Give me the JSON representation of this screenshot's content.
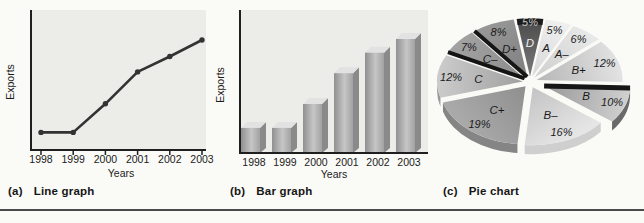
{
  "page": {
    "background": "#fafaf7",
    "divider_color": "#4a4a4a"
  },
  "chart_data": [
    {
      "type": "line",
      "caption_prefix": "(a)",
      "caption_label": "Line graph",
      "xlabel": "Years",
      "ylabel": "Exports",
      "categories": [
        "1998",
        "1999",
        "2000",
        "2001",
        "2002",
        "2003"
      ],
      "values": [
        16,
        16,
        42,
        71,
        85,
        100
      ],
      "ylim": [
        0,
        110
      ],
      "grid": false,
      "line_color": "#333333",
      "axis_color": "#1f1f1f",
      "plot_bg": "#ecece9"
    },
    {
      "type": "bar",
      "caption_prefix": "(b)",
      "caption_label": "Bar graph",
      "xlabel": "Years",
      "ylabel": "Exports",
      "categories": [
        "1998",
        "1999",
        "2000",
        "2001",
        "2002",
        "2003"
      ],
      "values": [
        22,
        22,
        43,
        70,
        88,
        100
      ],
      "ylim": [
        0,
        115
      ],
      "grid": false,
      "bar_colors": {
        "front_left": "#909090",
        "front_mid": "#c6c6c6",
        "front_right": "#a2a2a2",
        "top": "#e2e2e2",
        "side": "#8a8a8a"
      },
      "axis_color": "#1f1f1f",
      "plot_bg": "#ecece9"
    },
    {
      "type": "pie",
      "caption_prefix": "(c)",
      "caption_label": "Pie chart",
      "start_angle_deg": -9,
      "direction": "clockwise",
      "slices": [
        {
          "label": "D",
          "pct": 5,
          "inner": "#7a7a7a",
          "outer": "#4a4a4a",
          "letter_color": "#f0f0f0",
          "pct_color": "#c6c6c6",
          "accent": "arc",
          "accent_color": "#1c1c1c",
          "explode": 7,
          "letter_r": 0.58,
          "pct_r": 0.93
        },
        {
          "label": "A",
          "pct": 5,
          "inner": "#d8d8d8",
          "outer": "#efefef"
        },
        {
          "label": "A–",
          "pct": 6,
          "inner": "#cfcfcf",
          "outer": "#e8e8e8"
        },
        {
          "label": "B+",
          "pct": 12,
          "inner": "#b6b6b6",
          "outer": "#e2e2e2",
          "rim": "#d8d8d8"
        },
        {
          "label": "B",
          "pct": 10,
          "inner": "#989898",
          "outer": "#cfcfcf",
          "accent": "start",
          "accent_color": "#161616",
          "accent_width": 5,
          "rim": "#6a6a6a",
          "explode": 15
        },
        {
          "label": "B–",
          "pct": 16,
          "inner": "#c3c3c3",
          "outer": "#e5e5e5",
          "rim": "#cfcfcf"
        },
        {
          "label": "C+",
          "pct": 19,
          "inner": "#8f8f8f",
          "outer": "#a9a9a9",
          "rim": "#858585"
        },
        {
          "label": "C",
          "pct": 12,
          "inner": "#a0a0a0",
          "outer": "#cccccc",
          "rim": "#9a9a9a"
        },
        {
          "label": "C–",
          "pct": 7,
          "inner": "#8c8c8c",
          "outer": "#a2a2a2",
          "accent": "start",
          "accent_color": "#141414",
          "accent_width": 4
        },
        {
          "label": "D+",
          "pct": 8,
          "inner": "#7f7f7f",
          "outer": "#969696",
          "accent": "start",
          "accent_color": "#161616",
          "accent_width": 4
        }
      ]
    }
  ]
}
